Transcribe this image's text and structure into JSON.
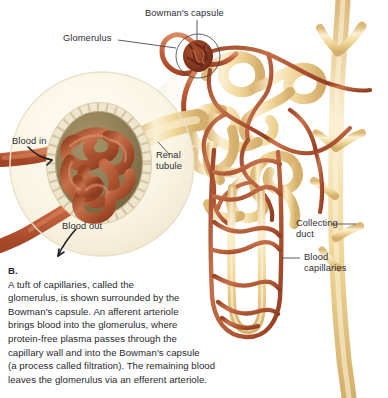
{
  "figure": {
    "labels": {
      "bowmans_capsule": "Bowman's capsule",
      "glomerulus": "Glomerulus",
      "renal_tubule_line1": "Renal",
      "renal_tubule_line2": "tubule",
      "blood_in": "Blood in",
      "blood_out": "Blood out",
      "collecting_duct_line1": "Collecting",
      "collecting_duct_line2": "duct",
      "blood_capillaries_line1": "Blood",
      "blood_capillaries_line2": "capillaries"
    }
  },
  "caption": {
    "lead": "B.",
    "lines": [
      "A tuft of capillaries, called the",
      "glomerulus, is shown surrounded by the",
      "Bowman's capsule. An afferent arteriole",
      "brings blood into the glomerulus, where",
      "protein-free plasma passes through the",
      "capillary wall and into the Bowman's capsule",
      "(a process called filtration). The remaining blood",
      "leaves the glomerulus via an efferent arteriole."
    ],
    "full_text": "B. A tuft of capillaries, called the glomerulus, is shown surrounded by the Bowman's capsule. An afferent arteriole brings blood into the glomerulus, where protein-free plasma passes through the capillary wall and into the Bowman's capsule (a process called filtration). The remaining blood leaves the glomerulus via an efferent arteriole."
  },
  "colors": {
    "page_background": "#ffffff",
    "tubule_tan": "#f0d79a",
    "tubule_tan_light": "#f7e9c4",
    "tubule_tan_shadow": "#d9b771",
    "capillary_red": "#b4552f",
    "capillary_red_light": "#d07d55",
    "arteriole_salmon": "#c4623f",
    "glomerulus_dark": "#8a3a22",
    "inset_background": "#fbf7e7",
    "capsule_bead": "#efe6cf",
    "capsule_interior": "#8e7c54",
    "label_text": "#2e2d33",
    "caption_text": "#29282d",
    "leader_line": "#4a4a52"
  }
}
